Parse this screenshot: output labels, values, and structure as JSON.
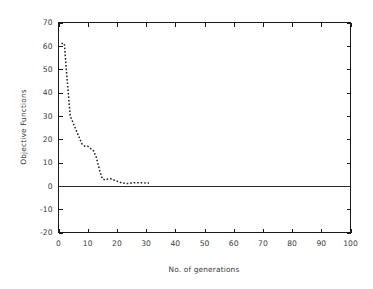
{
  "chart_data": {
    "type": "line",
    "title": "",
    "subtitle": "",
    "xlabel": "No. of generations",
    "ylabel": "Objective Functions",
    "xlim": [
      0,
      100
    ],
    "ylim": [
      -20,
      70
    ],
    "xticks": [
      0,
      10,
      20,
      30,
      40,
      50,
      60,
      70,
      80,
      90,
      100
    ],
    "yticks": [
      -20,
      -10,
      0,
      10,
      20,
      30,
      40,
      50,
      60,
      70
    ],
    "xtick_labels": [
      "0",
      "10",
      "20",
      "30",
      "40",
      "50",
      "60",
      "70",
      "80",
      "90",
      "100"
    ],
    "ytick_labels": [
      "-20",
      "-10",
      "0",
      "10",
      "20",
      "30",
      "40",
      "50",
      "60",
      "70"
    ],
    "grid": false,
    "legend": false,
    "legend_position": "none",
    "reference_lines": [
      {
        "name": "zero-line",
        "axis": "y",
        "value": 0,
        "style": "solid"
      }
    ],
    "series": [
      {
        "name": "Objective function value",
        "style": "dotted",
        "color": "#1f1f1f",
        "x": [
          1,
          2,
          3,
          4,
          5,
          6,
          7,
          8,
          9,
          10,
          11,
          12,
          13,
          14,
          15,
          16,
          17,
          18,
          19,
          20,
          21,
          22,
          23,
          24,
          25,
          26,
          27,
          28,
          29,
          30,
          31
        ],
        "values": [
          61,
          61,
          45,
          30,
          27,
          24,
          21,
          18,
          17,
          17,
          16,
          15,
          12,
          7,
          3,
          2.5,
          3,
          3,
          2.5,
          2,
          1.5,
          1.2,
          1,
          1,
          1.2,
          1.3,
          1.3,
          1.3,
          1.3,
          1.2,
          1.2
        ]
      }
    ]
  },
  "figure": {
    "background_color": "#ffffff",
    "axis_color": "#1a1a1a",
    "text_color": "#3a3a3a"
  }
}
